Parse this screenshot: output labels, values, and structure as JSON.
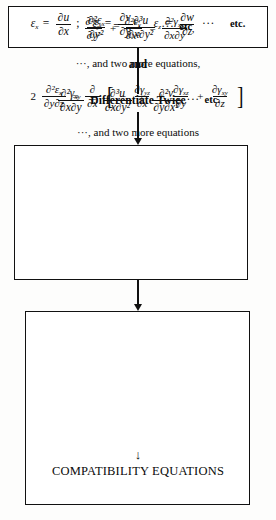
{
  "diagram": {
    "boxes": {
      "strain_definitions": {
        "name": "strain-definitions-box",
        "equations": [
          {
            "lhs_symbol": "ε",
            "lhs_subscript": "x",
            "numerator": "∂u",
            "denominator": "∂x",
            "trailing": ";"
          },
          {
            "lhs_symbol": "ε",
            "lhs_subscript": "y",
            "numerator": "∂v",
            "denominator": "∂y",
            "trailing": ";"
          },
          {
            "lhs_symbol": "ε",
            "lhs_subscript": "z",
            "numerator": "∂w",
            "denominator": "∂z",
            "trailing": ""
          }
        ],
        "ellipsis": "···",
        "etc_label": "etc."
      },
      "second_derivatives": {
        "name": "second-derivative-box",
        "equation_epsilon": {
          "lhs_numerator": "∂²ε",
          "lhs_numerator_subscript": "x",
          "lhs_denominator": "∂y²",
          "rhs_numerator": "∂³u",
          "rhs_denominator": "∂x∂y²",
          "ellipsis": "···",
          "etc_label": "etc"
        },
        "connector_word": "and",
        "equation_gamma": {
          "lhs_numerator": "∂²γ",
          "lhs_numerator_subscript": "xy",
          "lhs_denominator": "∂x∂y",
          "term1_numerator": "∂³u",
          "term1_denominator": "∂x∂y²",
          "plus": "+",
          "term2_numerator": "∂²v",
          "term2_denominator": "∂y∂x²",
          "ellipsis": "···",
          "etc_label": "etc."
        }
      },
      "compatibility": {
        "name": "compatibility-box",
        "equation_first": {
          "term1_numerator": "∂²ε",
          "term1_numerator_subscript": "x",
          "term1_denominator": "∂y²",
          "plus": "+",
          "term2_numerator": "∂²ε",
          "term2_numerator_subscript": "y",
          "term2_denominator": "∂x²",
          "equals": "=",
          "rhs_numerator": "∂²γ",
          "rhs_numerator_subscript": "xy",
          "rhs_denominator": "∂x∂y",
          "trailing": ","
        },
        "note_first": "···, and two more equations,",
        "equation_second": {
          "coefficient": "2",
          "lhs_numerator": "∂²ε",
          "lhs_numerator_subscript": "x",
          "lhs_denominator": "∂y∂z",
          "equals": "=",
          "operator_numerator": "∂",
          "operator_denominator": "∂x",
          "bracket_open": "[",
          "minus": "−",
          "term1_numerator": "∂γ",
          "term1_numerator_subscript": "yz",
          "term1_denominator": "∂x",
          "plus1": "+",
          "term2_numerator": "∂γ",
          "term2_numerator_subscript": "xz",
          "term2_denominator": "∂y",
          "plus2": "+",
          "term3_numerator": "∂γ",
          "term3_numerator_subscript": "xy",
          "term3_denominator": "∂z",
          "bracket_close": "]"
        },
        "note_second": "···, and two more equations",
        "down_arrow": "↓",
        "result_title": "COMPATIBILITY EQUATIONS"
      }
    },
    "connectors": {
      "differentiate_label": "Differentiate Twice"
    },
    "colors": {
      "ink": "#111111",
      "paper": "#fdfdfc"
    }
  }
}
